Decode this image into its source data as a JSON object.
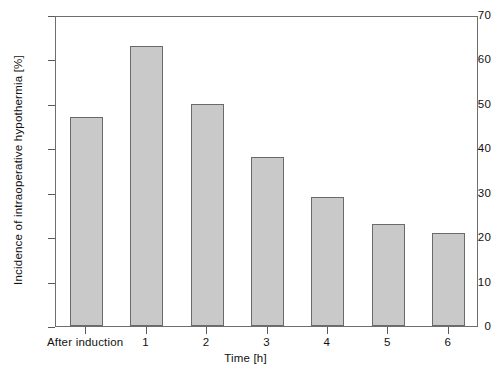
{
  "chart_data": {
    "type": "bar",
    "title": "",
    "subtitle": "",
    "xlabel": "Time [h]",
    "ylabel": "Incidence of intraoperative hypothermia [%]",
    "categories": [
      "After induction",
      "1",
      "2",
      "3",
      "4",
      "5",
      "6"
    ],
    "values": [
      47,
      63,
      50,
      38,
      29,
      23,
      21
    ],
    "series": [
      {
        "name": "Incidence of intraoperative hypothermia",
        "values": [
          47,
          63,
          50,
          38,
          29,
          23,
          21
        ]
      }
    ],
    "ylim": [
      0,
      70
    ],
    "yticks": [
      0,
      10,
      20,
      30,
      40,
      50,
      60,
      70
    ],
    "ytick_labels": [
      "0",
      "10",
      "20",
      "30",
      "40",
      "50",
      "60",
      "70"
    ],
    "xticks": [
      "After induction",
      "1",
      "2",
      "3",
      "4",
      "5",
      "6"
    ],
    "grid": false,
    "legend": false,
    "legend_position": "none",
    "annotations": [],
    "bar_fill_color": "#c9c9c9",
    "bar_edge_color": "#6a6a6a",
    "axis_color": "#6e6e6e",
    "text_color": "#111111",
    "background_color": "#ffffff"
  }
}
